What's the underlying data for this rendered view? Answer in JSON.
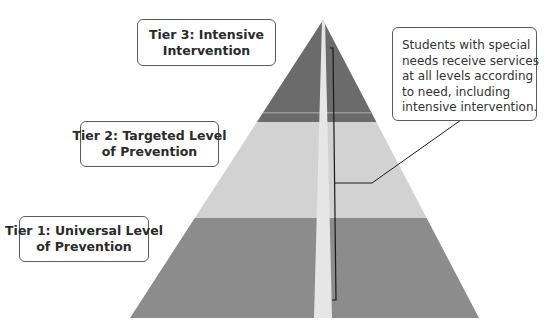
{
  "diagram": {
    "type": "tiered-pyramid",
    "colors": {
      "tier3": "#6b6b6b",
      "tier2": "#d2d2d2",
      "tier1": "#8c8c8c",
      "stripe": "#e8e8e8",
      "line": "#1a1a1a",
      "box_border": "#5a5a5a"
    },
    "tiers": [
      {
        "id": "tier3",
        "label_lines": [
          "Tier 3: Intensive",
          "Intervention"
        ],
        "position": "top"
      },
      {
        "id": "tier2",
        "label_lines": [
          "Tier 2: Targeted Level",
          "of Prevention"
        ],
        "position": "middle"
      },
      {
        "id": "tier1",
        "label_lines": [
          "Tier 1: Universal Level",
          "of Prevention"
        ],
        "position": "bottom"
      }
    ],
    "callout": {
      "lines": [
        "Students with special",
        "needs receive services",
        "at all levels according",
        "to need, including",
        "intensive intervention."
      ]
    }
  }
}
